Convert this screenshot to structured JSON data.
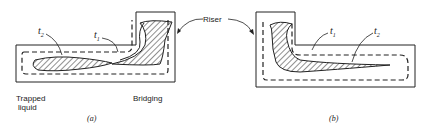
{
  "figure": {
    "labels": {
      "riser": "Riser",
      "t1": "t",
      "t1_sub": "1",
      "t2": "t",
      "t2_sub": "2",
      "trapped_liquid_line1": "Trapped",
      "trapped_liquid_line2": "liquid",
      "bridging": "Bridging",
      "caption_a": "(a)",
      "caption_b": "(b)"
    },
    "colors": {
      "stroke": "#222222",
      "background": "#ffffff"
    }
  }
}
